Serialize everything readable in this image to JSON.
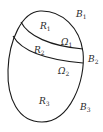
{
  "diagram": {
    "labels": {
      "R1": {
        "base": "R",
        "sub": "1"
      },
      "R2": {
        "base": "R",
        "sub": "2"
      },
      "R3": {
        "base": "R",
        "sub": "3"
      },
      "B1": {
        "base": "B",
        "sub": "1"
      },
      "B2": {
        "base": "B",
        "sub": "2"
      },
      "B3": {
        "base": "B",
        "sub": "3"
      },
      "Omega1": {
        "base": "Ω",
        "sub": "1"
      },
      "Omega2": {
        "base": "Ω",
        "sub": "2"
      }
    },
    "colors": {
      "stroke": "#1a1a1a",
      "text": "#2a2a2a",
      "background": "#ffffff"
    }
  }
}
